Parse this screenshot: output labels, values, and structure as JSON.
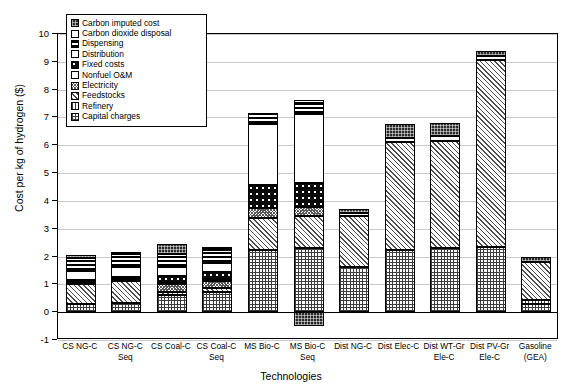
{
  "chart_data": {
    "type": "bar",
    "stacked": true,
    "title": "",
    "xlabel": "Technologies",
    "ylabel": "Cost per kg of hydrogen ($)",
    "ylim": [
      -1,
      10
    ],
    "yticks": [
      -1,
      0,
      1,
      2,
      3,
      4,
      5,
      6,
      7,
      8,
      9,
      10
    ],
    "grid": true,
    "legend_position": "top-left-inset",
    "categories": [
      "CS NG-C",
      "CS NG-C\nSeq",
      "CS Coal-C",
      "CS Coal-C\nSeq",
      "MS Bio-C",
      "MS Bio-C\nSeq",
      "Dist NG-C",
      "Dist Elec-C",
      "Dist WT-Gr\nEle-C",
      "Dist PV-Gr\nEle-C",
      "Gasoline\n(GEA)"
    ],
    "series": [
      {
        "name": "Capital charges",
        "pattern": "capital",
        "values": [
          0.28,
          0.32,
          0.62,
          0.72,
          2.22,
          2.3,
          1.62,
          2.25,
          2.32,
          2.33,
          0.3
        ]
      },
      {
        "name": "Refinery",
        "pattern": "refinery",
        "values": [
          0.0,
          0.0,
          0.0,
          0.0,
          0.0,
          0.0,
          0.0,
          0.0,
          0.0,
          0.0,
          0.12
        ]
      },
      {
        "name": "Feedstocks",
        "pattern": "feedstocks",
        "values": [
          0.72,
          0.8,
          0.12,
          0.14,
          1.17,
          1.15,
          1.85,
          3.85,
          3.85,
          6.72,
          1.38
        ]
      },
      {
        "name": "Electricity",
        "pattern": "electricity",
        "values": [
          0.0,
          0.0,
          0.26,
          0.26,
          0.34,
          0.34,
          0.0,
          0.0,
          0.0,
          0.0,
          0.0
        ]
      },
      {
        "name": "Nonfuel O&M",
        "pattern": "nonfuel",
        "values": [
          0.07,
          0.07,
          0.07,
          0.07,
          0.0,
          0.0,
          0.0,
          0.0,
          0.0,
          0.0,
          0.0
        ]
      },
      {
        "name": "Fixed costs",
        "pattern": "fixed",
        "values": [
          0.08,
          0.09,
          0.22,
          0.24,
          0.85,
          0.87,
          0.0,
          0.0,
          0.0,
          0.0,
          0.0
        ]
      },
      {
        "name": "Distribution",
        "pattern": "distribution",
        "values": [
          0.33,
          0.35,
          0.33,
          0.33,
          2.2,
          2.48,
          0.0,
          0.0,
          0.0,
          0.0,
          0.0
        ]
      },
      {
        "name": "Dispensing",
        "pattern": "dispensing",
        "values": [
          0.45,
          0.46,
          0.46,
          0.46,
          0.38,
          0.38,
          0.0,
          0.0,
          0.0,
          0.0,
          0.0
        ]
      },
      {
        "name": "Carbon dioxide disposal",
        "pattern": "co2-disposal",
        "values": [
          0.0,
          0.04,
          0.0,
          0.06,
          0.0,
          0.09,
          0.1,
          0.15,
          0.15,
          0.15,
          0.0
        ]
      },
      {
        "name": "Carbon imputed cost",
        "pattern": "carbon-imputed",
        "values": [
          0.12,
          0.05,
          0.37,
          0.06,
          0.0,
          0.0,
          0.14,
          0.52,
          0.47,
          0.2,
          0.2
        ]
      },
      {
        "name": "Carbon imputed cost (negative)",
        "pattern": "carbon-imputed",
        "negative": true,
        "values": [
          0,
          0,
          0,
          0,
          0,
          -0.5,
          0,
          0,
          0,
          0,
          0
        ]
      }
    ],
    "totals": [
      2.05,
      2.18,
      2.45,
      2.34,
      7.16,
      7.61,
      3.71,
      6.77,
      6.79,
      9.4,
      2.0
    ]
  },
  "legend": {
    "items": [
      {
        "label": "Carbon imputed cost",
        "pattern": "carbon-imputed"
      },
      {
        "label": "Carbon dioxide disposal",
        "pattern": "co2-disposal"
      },
      {
        "label": "Dispensing",
        "pattern": "dispensing"
      },
      {
        "label": "Distribution",
        "pattern": "distribution"
      },
      {
        "label": "Fixed costs",
        "pattern": "fixed"
      },
      {
        "label": "Nonfuel O&M",
        "pattern": "nonfuel"
      },
      {
        "label": "Electricity",
        "pattern": "electricity"
      },
      {
        "label": "Feedstocks",
        "pattern": "feedstocks"
      },
      {
        "label": "Refinery",
        "pattern": "refinery"
      },
      {
        "label": "Capital charges",
        "pattern": "capital"
      }
    ]
  },
  "colors": {
    "grid": "#c9c9c9",
    "axis": "#000000",
    "background": "#ffffff"
  }
}
